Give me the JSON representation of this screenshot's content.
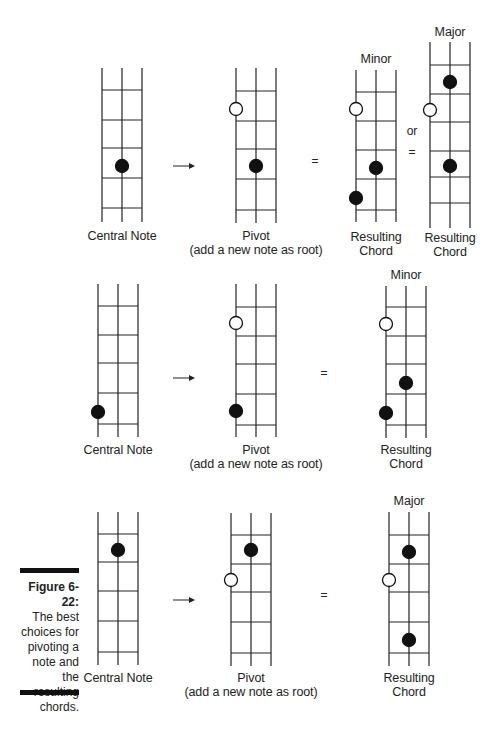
{
  "figure": {
    "caption_title": "Figure 6-22:",
    "caption_lines": [
      "The best",
      "choices for",
      "pivoting a",
      "note and",
      "the resulting",
      "chords."
    ]
  },
  "symbols": {
    "arrow": "→",
    "equals": "=",
    "or": "or"
  },
  "diagrams": [
    {
      "id": "r1-central",
      "x": 102,
      "top": 68,
      "frets": [
        90,
        120,
        148,
        178,
        208
      ],
      "bottom": 222,
      "dots": [
        {
          "s": 1,
          "y": 166,
          "filled": true
        }
      ],
      "label": [
        "Central Note"
      ],
      "label_y": 226
    },
    {
      "id": "r1-pivot",
      "x": 236,
      "top": 68,
      "frets": [
        91,
        121,
        149,
        179,
        210
      ],
      "bottom": 223,
      "dots": [
        {
          "s": 0,
          "y": 109,
          "filled": false
        },
        {
          "s": 1,
          "y": 166,
          "filled": true
        }
      ],
      "label": [
        "Pivot",
        "(add a new note as root)"
      ],
      "label_y": 226
    },
    {
      "id": "r1-minor",
      "x": 356,
      "top": 70,
      "frets": [
        92,
        121,
        150,
        179,
        210
      ],
      "bottom": 222,
      "dots": [
        {
          "s": 0,
          "y": 109,
          "filled": false
        },
        {
          "s": 1,
          "y": 168,
          "filled": true
        },
        {
          "s": 0,
          "y": 198,
          "filled": true
        }
      ],
      "title": "Minor",
      "title_y": 52,
      "label": [
        "Resulting",
        "Chord"
      ],
      "label_y": 227
    },
    {
      "id": "r1-major",
      "x": 430,
      "top": 42,
      "frets": [
        65,
        94,
        122,
        151,
        177,
        203
      ],
      "bottom": 228,
      "dots": [
        {
          "s": 1,
          "y": 82,
          "filled": true
        },
        {
          "s": 0,
          "y": 110,
          "filled": false
        },
        {
          "s": 1,
          "y": 166,
          "filled": true
        }
      ],
      "title": "Major",
      "title_y": 25,
      "label": [
        "Resulting",
        "Chord"
      ],
      "label_y": 228
    },
    {
      "id": "r2-central",
      "x": 98,
      "top": 284,
      "frets": [
        306,
        335,
        363,
        393,
        424
      ],
      "bottom": 437,
      "dots": [
        {
          "s": 0,
          "y": 412,
          "filled": true
        }
      ],
      "label": [
        "Central Note"
      ],
      "label_y": 440
    },
    {
      "id": "r2-pivot",
      "x": 236,
      "top": 284,
      "frets": [
        307,
        336,
        364,
        394,
        425
      ],
      "bottom": 437,
      "dots": [
        {
          "s": 0,
          "y": 323,
          "filled": false
        },
        {
          "s": 0,
          "y": 411,
          "filled": true
        }
      ],
      "label": [
        "Pivot",
        "(add a new note as root)"
      ],
      "label_y": 440
    },
    {
      "id": "r2-minor",
      "x": 386,
      "top": 286,
      "frets": [
        307,
        336,
        364,
        394,
        425
      ],
      "bottom": 438,
      "dots": [
        {
          "s": 0,
          "y": 324,
          "filled": false
        },
        {
          "s": 1,
          "y": 383,
          "filled": true
        },
        {
          "s": 0,
          "y": 413,
          "filled": true
        }
      ],
      "title": "Minor",
      "title_y": 268,
      "label": [
        "Resulting",
        "Chord"
      ],
      "label_y": 440
    },
    {
      "id": "r3-central",
      "x": 98,
      "top": 512,
      "frets": [
        534,
        562,
        591,
        621,
        652
      ],
      "bottom": 665,
      "dots": [
        {
          "s": 1,
          "y": 550,
          "filled": true
        }
      ],
      "label": [
        "Central Note"
      ],
      "label_y": 668
    },
    {
      "id": "r3-pivot",
      "x": 231,
      "top": 513,
      "frets": [
        535,
        564,
        592,
        622,
        653
      ],
      "bottom": 666,
      "dots": [
        {
          "s": 1,
          "y": 550,
          "filled": true
        },
        {
          "s": 0,
          "y": 580,
          "filled": false
        }
      ],
      "label": [
        "Pivot",
        "(add a new note as root)"
      ],
      "label_y": 668
    },
    {
      "id": "r3-major",
      "x": 389,
      "top": 512,
      "frets": [
        535,
        564,
        592,
        622,
        653
      ],
      "bottom": 666,
      "dots": [
        {
          "s": 1,
          "y": 552,
          "filled": true
        },
        {
          "s": 0,
          "y": 580,
          "filled": false
        },
        {
          "s": 1,
          "y": 640,
          "filled": true
        }
      ],
      "title": "Major",
      "title_y": 494,
      "label": [
        "Resulting",
        "Chord"
      ],
      "label_y": 668
    }
  ],
  "operators": [
    {
      "type": "arrow",
      "x": 181,
      "y": 166
    },
    {
      "type": "equals",
      "x": 315,
      "y": 162
    },
    {
      "type": "or",
      "x": 412,
      "y": 132
    },
    {
      "type": "equals",
      "x": 412,
      "y": 153
    },
    {
      "type": "arrow",
      "x": 181,
      "y": 378
    },
    {
      "type": "equals",
      "x": 324,
      "y": 374
    },
    {
      "type": "arrow",
      "x": 181,
      "y": 600
    },
    {
      "type": "equals",
      "x": 324,
      "y": 596
    }
  ],
  "string_spacing": 20,
  "dot_radius": 6.5
}
